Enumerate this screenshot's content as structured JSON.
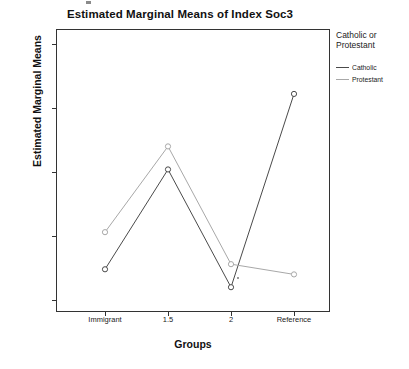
{
  "chart_data": {
    "type": "line",
    "title": "Estimated Marginal Means of Index Soc3",
    "xlabel": "Groups",
    "ylabel": "Estimated Marginal Means",
    "categories": [
      "Immigrant",
      "1.5",
      "2",
      "Reference"
    ],
    "yticks": [
      "2.05",
      "2.10",
      "2.15",
      "2.20",
      "2.25"
    ],
    "ytick_values": [
      2.05,
      2.1,
      2.15,
      2.2,
      2.25
    ],
    "ylim": [
      2.038,
      2.262
    ],
    "grid": false,
    "legend_position": "right",
    "legend_title": "Catholic or Protestant",
    "series": [
      {
        "name": "Catholic",
        "color": "#4a4a4a",
        "values": [
          2.074,
          2.152,
          2.06,
          2.211
        ]
      },
      {
        "name": "Protestant",
        "color": "#a8a8a8",
        "values": [
          2.103,
          2.17,
          2.078,
          2.07
        ]
      }
    ]
  },
  "legend": {
    "title_line1": "Catholic or",
    "title_line2": "Protestant",
    "entries": [
      {
        "label": "Catholic",
        "color": "#4a4a4a"
      },
      {
        "label": "Protestant",
        "color": "#a8a8a8"
      }
    ]
  },
  "axes": {
    "y_label": "Estimated Marginal Means",
    "x_label": "Groups",
    "y_ticks": [
      "2.25",
      "2.20",
      "2.15",
      "2.10",
      "2.05"
    ],
    "x_ticks": [
      "Immigrant",
      "1.5",
      "2",
      "Reference"
    ]
  },
  "header": {
    "title": "Estimated Marginal Means of Index Soc3"
  }
}
